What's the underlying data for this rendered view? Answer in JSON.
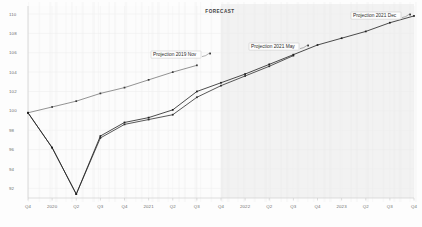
{
  "chart_data": {
    "type": "line",
    "title": "",
    "subtitle": "",
    "xlabel": "",
    "ylabel": "",
    "ylim": [
      91,
      110
    ],
    "xlim": [
      0,
      16
    ],
    "grid": true,
    "legend_position": "inline-annotations",
    "y_ticks": [
      110,
      108,
      106,
      104,
      102,
      100,
      98,
      96,
      94,
      92
    ],
    "categories": [
      "Q4",
      "2020",
      "Q2",
      "Q3",
      "Q4",
      "2021",
      "Q2",
      "Q3",
      "Q4",
      "2022",
      "Q2",
      "Q3",
      "Q4",
      "2023",
      "Q2",
      "Q3",
      "Q4"
    ],
    "x": [
      0,
      1,
      2,
      3,
      4,
      5,
      6,
      7,
      8,
      9,
      10,
      11,
      12,
      13,
      14,
      15,
      16
    ],
    "forecast_start_index": 8,
    "forecast_band_label": "FORECAST",
    "series": [
      {
        "name": "Projection 2019 Nov",
        "color": "#3a3a3a",
        "annotation": "Projection 2019 Nov",
        "x": [
          0,
          1,
          2,
          3,
          4,
          5,
          6,
          7
        ],
        "values": [
          99.8,
          100.4,
          101.0,
          101.8,
          102.4,
          103.2,
          104.0,
          104.7
        ]
      },
      {
        "name": "Projection 2021 May",
        "color": "#2f2f2f",
        "annotation": "Projection 2021 May",
        "x": [
          0,
          1,
          2,
          3,
          4,
          5,
          6,
          7,
          8,
          9,
          10,
          11
        ],
        "values": [
          99.8,
          96.2,
          91.4,
          97.2,
          98.6,
          99.1,
          99.6,
          101.4,
          102.6,
          103.6,
          104.6,
          105.7
        ]
      },
      {
        "name": "Projection 2021 Dec",
        "color": "#1f1f1f",
        "annotation": "Projection 2021 Dec",
        "x": [
          0,
          1,
          2,
          3,
          4,
          5,
          6,
          7,
          8,
          9,
          10,
          11,
          12,
          13,
          14,
          15,
          16
        ],
        "values": [
          99.8,
          96.2,
          91.4,
          97.4,
          98.8,
          99.3,
          100.1,
          102.0,
          102.9,
          103.8,
          104.8,
          105.8,
          106.8,
          107.5,
          108.2,
          109.1,
          109.8
        ]
      }
    ],
    "annotations": [
      {
        "text": "Projection 2019 Nov",
        "series": "Projection 2019 Nov"
      },
      {
        "text": "Projection 2021 May",
        "series": "Projection 2021 May"
      },
      {
        "text": "Projection 2021 Dec",
        "series": "Projection 2021 Dec"
      }
    ]
  }
}
